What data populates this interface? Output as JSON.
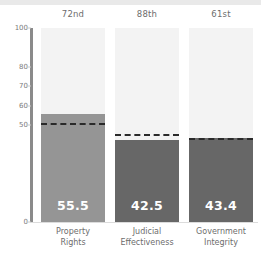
{
  "chart_data": {
    "type": "bar",
    "title": "",
    "subtitle": "",
    "xlabel": "",
    "ylabel": "",
    "ylim": [
      0,
      100
    ],
    "grid": false,
    "legend": "none",
    "categories": [
      "Property Rights",
      "Judicial Effectiveness",
      "Government Integrity"
    ],
    "category_lines": [
      [
        "Property",
        "Rights"
      ],
      [
        "Judicial",
        "Effectiveness"
      ],
      [
        "Government",
        "Integrity"
      ]
    ],
    "values": [
      55.5,
      42.5,
      43.4
    ],
    "value_labels": [
      "55.5",
      "42.5",
      "43.4"
    ],
    "rank_labels": [
      "72nd",
      "88th",
      "61st"
    ],
    "reference_lines": [
      51.0,
      45.5,
      43.5
    ],
    "yticks": [
      100,
      80,
      70,
      60,
      50,
      0
    ],
    "ytick_labels": [
      "100",
      "80",
      "70",
      "60",
      "50",
      "0"
    ],
    "bar_colors": [
      "#959595",
      "#676767",
      "#676767"
    ],
    "track_color": "#f3f3f3",
    "reference_line_color": "#2a2a2a",
    "axis_color": "#8a8a8a",
    "value_label_color": "#ffffff",
    "tick_label_color": "#7b7b7b",
    "background_color": "#ffffff"
  }
}
